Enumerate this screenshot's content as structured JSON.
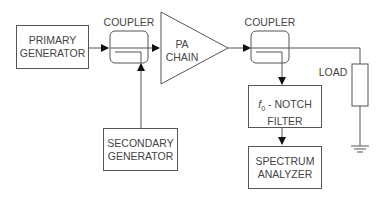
{
  "diagram": {
    "blocks": {
      "primary_generator": "PRIMARY\nGENERATOR",
      "secondary_generator": "SECONDARY\nGENERATOR",
      "pa_chain_line1": "PA",
      "pa_chain_line2": "CHAIN",
      "notch_filter_symbol": "f",
      "notch_filter_subscript": "0",
      "notch_filter_rest": " - NOTCH",
      "notch_filter_line2": "FILTER",
      "spectrum_analyzer": "SPECTRUM\nANALYZER"
    },
    "labels": {
      "coupler_1": "COUPLER",
      "coupler_2": "COUPLER",
      "load": "LOAD"
    },
    "colors": {
      "line": "#555555",
      "background": "#ffffff"
    }
  }
}
